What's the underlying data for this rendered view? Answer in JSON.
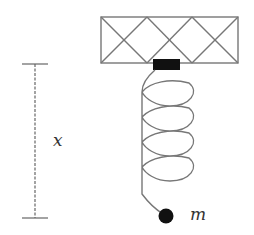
{
  "diagram": {
    "type": "spring-mass system hanging from ceiling support",
    "labels": {
      "displacement": "x",
      "mass": "m"
    },
    "colors": {
      "line": "#777777",
      "block": "#111111",
      "mass": "#111111",
      "dimension": "#666666"
    }
  }
}
